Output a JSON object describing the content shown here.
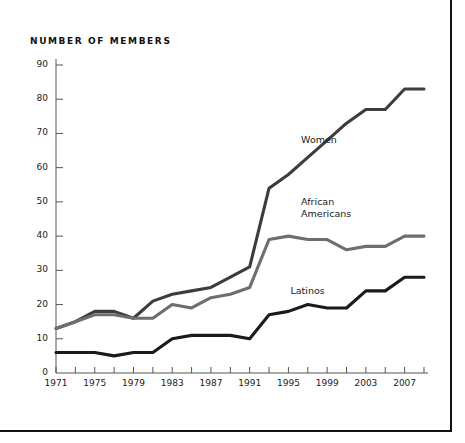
{
  "chart_title": "NUMBER OF MEMBERS",
  "colors": {
    "women": "#3d3d3d",
    "african_americans": "#6e6e6e",
    "latinos": "#1a1a1a",
    "axis": "#555555",
    "text": "#1a1a1a",
    "frame": "#111111",
    "background": "#ffffff"
  },
  "axis": {
    "y_ticks": [
      0,
      10,
      20,
      30,
      40,
      50,
      60,
      70,
      80,
      90
    ],
    "x_labels": [
      "1971",
      "1975",
      "1979",
      "1983",
      "1987",
      "1991",
      "1995",
      "1999",
      "2003",
      "2007"
    ],
    "x_tick_years": [
      1971,
      1973,
      1975,
      1977,
      1979,
      1981,
      1983,
      1985,
      1987,
      1989,
      1991,
      1993,
      1995,
      1997,
      1999,
      2001,
      2003,
      2005,
      2007,
      2009
    ]
  },
  "series_labels": {
    "women": "Women",
    "african_americans_line1": "African",
    "african_americans_line2": "Americans",
    "latinos": "Latinos"
  },
  "chart_data": {
    "type": "line",
    "title": "NUMBER OF MEMBERS",
    "xlabel": "",
    "ylabel": "NUMBER OF MEMBERS",
    "xlim": [
      1971,
      2009
    ],
    "ylim": [
      0,
      90
    ],
    "grid": false,
    "legend": "inline-labels",
    "x": [
      1971,
      1973,
      1975,
      1977,
      1979,
      1981,
      1983,
      1985,
      1987,
      1989,
      1991,
      1993,
      1995,
      1997,
      1999,
      2001,
      2003,
      2005,
      2007,
      2009
    ],
    "series": [
      {
        "name": "Women",
        "color": "#3d3d3d",
        "values": [
          13,
          15,
          18,
          18,
          16,
          21,
          23,
          24,
          25,
          28,
          31,
          54,
          58,
          63,
          68,
          73,
          77,
          77,
          83,
          83
        ]
      },
      {
        "name": "African Americans",
        "color": "#6e6e6e",
        "values": [
          13,
          15,
          17,
          17,
          16,
          16,
          20,
          19,
          22,
          23,
          25,
          39,
          40,
          39,
          39,
          36,
          37,
          37,
          40,
          40
        ]
      },
      {
        "name": "Latinos",
        "color": "#1a1a1a",
        "values": [
          6,
          6,
          6,
          5,
          6,
          6,
          10,
          11,
          11,
          11,
          10,
          17,
          18,
          20,
          19,
          19,
          24,
          24,
          28,
          28
        ]
      }
    ]
  }
}
